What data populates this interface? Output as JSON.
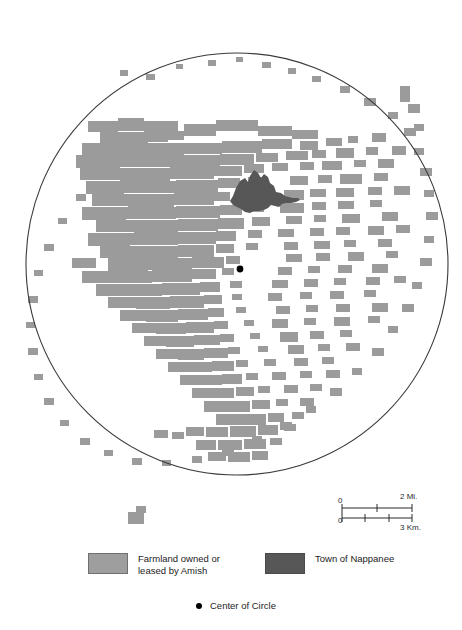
{
  "map": {
    "title": "Amish farmland around Nappanee",
    "colors": {
      "farmland": "#9b9b9b",
      "farmland_edge": "#8e8e8e",
      "town": "#575757",
      "circle_stroke": "#3a3a3a",
      "center_dot": "#000000",
      "background": "#ffffff"
    },
    "circle": {
      "center_x": 237,
      "center_y": 264,
      "radius": 211
    },
    "center_point": {
      "x": 240,
      "y": 269,
      "radius": 3.4
    },
    "town_polygon": "233,196 236,188 240,181 245,178 248,182 250,176 254,170 258,173 261,178 264,174 268,177 270,183 274,186 276,192 281,193 285,196 289,197 293,198 298,198 300,200 296,202 291,203 286,203 282,204 279,207 275,206 271,205 268,208 264,210 259,211 254,211 250,213 245,212 241,209 237,207 233,205 230,201",
    "farmland_cells": [
      [
        88,
        121,
        30,
        11
      ],
      [
        118,
        118,
        26,
        13
      ],
      [
        144,
        121,
        34,
        12
      ],
      [
        100,
        132,
        48,
        12
      ],
      [
        148,
        132,
        20,
        10
      ],
      [
        168,
        131,
        16,
        9
      ],
      [
        184,
        124,
        32,
        12
      ],
      [
        216,
        120,
        42,
        11
      ],
      [
        258,
        126,
        34,
        10
      ],
      [
        292,
        130,
        26,
        9
      ],
      [
        82,
        143,
        40,
        12
      ],
      [
        122,
        143,
        62,
        12
      ],
      [
        184,
        143,
        38,
        11
      ],
      [
        222,
        141,
        40,
        12
      ],
      [
        262,
        139,
        30,
        10
      ],
      [
        300,
        141,
        18,
        9
      ],
      [
        326,
        138,
        16,
        8
      ],
      [
        348,
        136,
        10,
        7
      ],
      [
        372,
        133,
        14,
        9
      ],
      [
        76,
        155,
        44,
        13
      ],
      [
        120,
        155,
        54,
        12
      ],
      [
        174,
        155,
        46,
        12
      ],
      [
        220,
        154,
        34,
        11
      ],
      [
        256,
        153,
        22,
        9
      ],
      [
        286,
        151,
        22,
        9
      ],
      [
        312,
        150,
        14,
        8
      ],
      [
        336,
        148,
        18,
        10
      ],
      [
        366,
        147,
        12,
        8
      ],
      [
        392,
        146,
        14,
        9
      ],
      [
        80,
        168,
        40,
        12
      ],
      [
        120,
        168,
        50,
        13
      ],
      [
        170,
        167,
        44,
        12
      ],
      [
        214,
        166,
        28,
        10
      ],
      [
        244,
        164,
        20,
        9
      ],
      [
        272,
        163,
        16,
        8
      ],
      [
        300,
        162,
        14,
        8
      ],
      [
        322,
        161,
        20,
        9
      ],
      [
        354,
        160,
        12,
        7
      ],
      [
        378,
        159,
        16,
        9
      ],
      [
        86,
        181,
        38,
        13
      ],
      [
        124,
        181,
        52,
        12
      ],
      [
        176,
        180,
        42,
        13
      ],
      [
        218,
        178,
        22,
        10
      ],
      [
        248,
        177,
        14,
        8
      ],
      [
        290,
        176,
        18,
        9
      ],
      [
        318,
        175,
        14,
        8
      ],
      [
        340,
        174,
        22,
        10
      ],
      [
        374,
        173,
        14,
        8
      ],
      [
        92,
        194,
        36,
        12
      ],
      [
        128,
        194,
        46,
        13
      ],
      [
        174,
        193,
        40,
        12
      ],
      [
        214,
        192,
        16,
        9
      ],
      [
        242,
        191,
        12,
        7
      ],
      [
        284,
        190,
        20,
        10
      ],
      [
        310,
        189,
        16,
        8
      ],
      [
        336,
        188,
        18,
        9
      ],
      [
        368,
        187,
        14,
        8
      ],
      [
        394,
        186,
        16,
        9
      ],
      [
        82,
        207,
        44,
        13
      ],
      [
        126,
        207,
        50,
        12
      ],
      [
        176,
        206,
        44,
        12
      ],
      [
        220,
        205,
        22,
        10
      ],
      [
        250,
        204,
        14,
        8
      ],
      [
        280,
        203,
        24,
        10
      ],
      [
        312,
        202,
        14,
        8
      ],
      [
        338,
        201,
        16,
        8
      ],
      [
        370,
        200,
        12,
        7
      ],
      [
        96,
        220,
        38,
        12
      ],
      [
        134,
        220,
        44,
        13
      ],
      [
        178,
        219,
        40,
        12
      ],
      [
        218,
        218,
        26,
        11
      ],
      [
        252,
        217,
        18,
        9
      ],
      [
        286,
        216,
        16,
        8
      ],
      [
        314,
        215,
        12,
        7
      ],
      [
        342,
        214,
        18,
        9
      ],
      [
        382,
        212,
        16,
        9
      ],
      [
        88,
        233,
        42,
        13
      ],
      [
        130,
        233,
        48,
        12
      ],
      [
        178,
        232,
        38,
        12
      ],
      [
        216,
        231,
        20,
        10
      ],
      [
        248,
        230,
        14,
        8
      ],
      [
        278,
        229,
        16,
        8
      ],
      [
        310,
        228,
        14,
        8
      ],
      [
        336,
        227,
        14,
        8
      ],
      [
        368,
        226,
        16,
        9
      ],
      [
        396,
        225,
        14,
        8
      ],
      [
        100,
        246,
        36,
        12
      ],
      [
        136,
        246,
        42,
        12
      ],
      [
        178,
        245,
        36,
        12
      ],
      [
        216,
        244,
        18,
        9
      ],
      [
        246,
        243,
        12,
        7
      ],
      [
        284,
        242,
        14,
        8
      ],
      [
        314,
        241,
        16,
        8
      ],
      [
        344,
        240,
        12,
        7
      ],
      [
        378,
        239,
        14,
        8
      ],
      [
        72,
        258,
        24,
        10
      ],
      [
        108,
        258,
        40,
        13
      ],
      [
        148,
        258,
        44,
        12
      ],
      [
        192,
        257,
        32,
        11
      ],
      [
        226,
        256,
        14,
        8
      ],
      [
        286,
        254,
        16,
        8
      ],
      [
        316,
        253,
        14,
        8
      ],
      [
        348,
        252,
        16,
        9
      ],
      [
        386,
        251,
        12,
        7
      ],
      [
        82,
        271,
        32,
        12
      ],
      [
        114,
        271,
        38,
        12
      ],
      [
        152,
        270,
        40,
        12
      ],
      [
        192,
        269,
        24,
        10
      ],
      [
        222,
        268,
        12,
        7
      ],
      [
        278,
        267,
        14,
        8
      ],
      [
        308,
        266,
        12,
        7
      ],
      [
        338,
        265,
        14,
        8
      ],
      [
        372,
        264,
        16,
        9
      ],
      [
        96,
        284,
        30,
        12
      ],
      [
        126,
        284,
        36,
        12
      ],
      [
        162,
        283,
        38,
        12
      ],
      [
        200,
        282,
        20,
        10
      ],
      [
        230,
        281,
        12,
        7
      ],
      [
        272,
        280,
        16,
        8
      ],
      [
        304,
        279,
        14,
        8
      ],
      [
        334,
        278,
        12,
        7
      ],
      [
        366,
        277,
        14,
        8
      ],
      [
        394,
        276,
        12,
        7
      ],
      [
        108,
        297,
        28,
        11
      ],
      [
        136,
        297,
        34,
        12
      ],
      [
        170,
        296,
        34,
        12
      ],
      [
        204,
        295,
        18,
        9
      ],
      [
        232,
        294,
        10,
        6
      ],
      [
        268,
        293,
        14,
        8
      ],
      [
        300,
        292,
        12,
        7
      ],
      [
        330,
        291,
        14,
        8
      ],
      [
        364,
        290,
        12,
        7
      ],
      [
        120,
        310,
        26,
        11
      ],
      [
        146,
        310,
        32,
        12
      ],
      [
        178,
        309,
        30,
        11
      ],
      [
        208,
        308,
        16,
        9
      ],
      [
        236,
        307,
        10,
        6
      ],
      [
        276,
        306,
        14,
        8
      ],
      [
        306,
        305,
        12,
        7
      ],
      [
        336,
        304,
        14,
        8
      ],
      [
        372,
        303,
        16,
        9
      ],
      [
        132,
        323,
        24,
        10
      ],
      [
        156,
        323,
        30,
        11
      ],
      [
        186,
        322,
        28,
        11
      ],
      [
        214,
        321,
        14,
        8
      ],
      [
        244,
        320,
        10,
        6
      ],
      [
        272,
        319,
        16,
        9
      ],
      [
        304,
        318,
        12,
        7
      ],
      [
        334,
        317,
        16,
        9
      ],
      [
        368,
        316,
        12,
        7
      ],
      [
        144,
        336,
        22,
        10
      ],
      [
        166,
        336,
        28,
        11
      ],
      [
        194,
        335,
        26,
        10
      ],
      [
        220,
        334,
        14,
        8
      ],
      [
        250,
        333,
        10,
        6
      ],
      [
        280,
        332,
        18,
        10
      ],
      [
        310,
        331,
        14,
        8
      ],
      [
        340,
        330,
        12,
        7
      ],
      [
        156,
        349,
        22,
        10
      ],
      [
        178,
        349,
        26,
        11
      ],
      [
        204,
        348,
        24,
        10
      ],
      [
        228,
        347,
        12,
        7
      ],
      [
        258,
        346,
        10,
        6
      ],
      [
        288,
        345,
        16,
        9
      ],
      [
        318,
        344,
        12,
        7
      ],
      [
        346,
        343,
        14,
        8
      ],
      [
        168,
        362,
        20,
        10
      ],
      [
        188,
        362,
        24,
        10
      ],
      [
        212,
        361,
        22,
        10
      ],
      [
        236,
        360,
        12,
        7
      ],
      [
        264,
        359,
        12,
        7
      ],
      [
        294,
        358,
        14,
        8
      ],
      [
        322,
        357,
        12,
        7
      ],
      [
        180,
        375,
        20,
        10
      ],
      [
        200,
        375,
        22,
        10
      ],
      [
        222,
        374,
        20,
        10
      ],
      [
        246,
        373,
        12,
        7
      ],
      [
        272,
        372,
        14,
        8
      ],
      [
        300,
        371,
        12,
        7
      ],
      [
        326,
        370,
        14,
        8
      ],
      [
        192,
        388,
        20,
        10
      ],
      [
        212,
        388,
        22,
        10
      ],
      [
        236,
        387,
        18,
        9
      ],
      [
        258,
        386,
        12,
        7
      ],
      [
        284,
        385,
        14,
        8
      ],
      [
        310,
        384,
        12,
        7
      ],
      [
        204,
        401,
        22,
        11
      ],
      [
        226,
        401,
        24,
        11
      ],
      [
        252,
        400,
        18,
        9
      ],
      [
        276,
        399,
        12,
        7
      ],
      [
        300,
        398,
        14,
        8
      ],
      [
        216,
        414,
        24,
        11
      ],
      [
        240,
        414,
        26,
        11
      ],
      [
        268,
        413,
        16,
        9
      ],
      [
        292,
        412,
        12,
        7
      ],
      [
        186,
        427,
        18,
        9
      ],
      [
        206,
        427,
        22,
        10
      ],
      [
        230,
        426,
        26,
        11
      ],
      [
        258,
        425,
        20,
        10
      ],
      [
        284,
        424,
        12,
        7
      ],
      [
        196,
        440,
        20,
        10
      ],
      [
        218,
        440,
        24,
        10
      ],
      [
        244,
        439,
        22,
        10
      ],
      [
        270,
        438,
        12,
        7
      ],
      [
        208,
        452,
        18,
        9
      ],
      [
        228,
        452,
        22,
        10
      ],
      [
        252,
        451,
        16,
        9
      ],
      [
        154,
        430,
        14,
        8
      ],
      [
        172,
        432,
        12,
        7
      ],
      [
        120,
        70,
        8,
        6
      ],
      [
        146,
        74,
        9,
        6
      ],
      [
        176,
        64,
        7,
        5
      ],
      [
        208,
        60,
        8,
        6
      ],
      [
        236,
        57,
        7,
        5
      ],
      [
        262,
        62,
        9,
        6
      ],
      [
        288,
        68,
        8,
        6
      ],
      [
        312,
        76,
        9,
        6
      ],
      [
        340,
        86,
        10,
        7
      ],
      [
        364,
        98,
        12,
        8
      ],
      [
        388,
        112,
        10,
        7
      ],
      [
        404,
        128,
        12,
        8
      ],
      [
        414,
        148,
        10,
        7
      ],
      [
        420,
        168,
        12,
        8
      ],
      [
        424,
        190,
        10,
        7
      ],
      [
        426,
        212,
        12,
        8
      ],
      [
        424,
        236,
        10,
        7
      ],
      [
        420,
        258,
        12,
        8
      ],
      [
        412,
        282,
        10,
        7
      ],
      [
        402,
        304,
        12,
        8
      ],
      [
        388,
        326,
        10,
        7
      ],
      [
        372,
        348,
        12,
        8
      ],
      [
        352,
        368,
        10,
        7
      ],
      [
        330,
        388,
        12,
        8
      ],
      [
        306,
        406,
        10,
        7
      ],
      [
        280,
        422,
        12,
        8
      ],
      [
        252,
        436,
        10,
        7
      ],
      [
        222,
        448,
        12,
        8
      ],
      [
        192,
        456,
        10,
        7
      ],
      [
        162,
        460,
        9,
        6
      ],
      [
        132,
        458,
        10,
        7
      ],
      [
        104,
        450,
        9,
        6
      ],
      [
        80,
        438,
        10,
        7
      ],
      [
        60,
        420,
        9,
        6
      ],
      [
        44,
        398,
        10,
        7
      ],
      [
        34,
        374,
        9,
        6
      ],
      [
        28,
        348,
        10,
        7
      ],
      [
        26,
        322,
        9,
        6
      ],
      [
        28,
        296,
        10,
        7
      ],
      [
        34,
        270,
        9,
        6
      ],
      [
        44,
        244,
        10,
        7
      ],
      [
        58,
        218,
        9,
        6
      ],
      [
        76,
        194,
        10,
        7
      ],
      [
        98,
        170,
        9,
        6
      ],
      [
        124,
        148,
        10,
        7
      ],
      [
        128,
        512,
        16,
        12
      ],
      [
        136,
        506,
        10,
        7
      ],
      [
        400,
        86,
        10,
        16
      ],
      [
        408,
        104,
        12,
        9
      ],
      [
        414,
        124,
        10,
        7
      ]
    ],
    "scale": {
      "miles": {
        "zero": "0",
        "max": "2 Mi."
      },
      "km": {
        "zero": "0",
        "max": "3 Km."
      }
    }
  },
  "legend": {
    "farmland": {
      "label": "Farmland owned or\nleased by Amish",
      "swatch_color": "#9e9e9e"
    },
    "town": {
      "label": "Town of Nappanee",
      "swatch_color": "#575757"
    },
    "center": {
      "label": "Center of Circle"
    }
  }
}
